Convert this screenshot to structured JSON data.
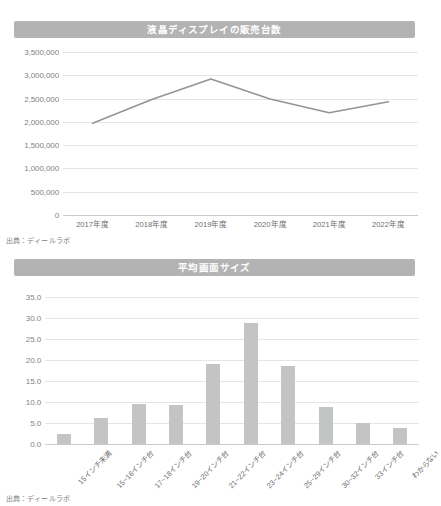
{
  "page": {
    "background_color": "#ffffff",
    "banner_color": "#b3b3b4",
    "bar_color": "#c3c4c5",
    "line_color": "#929497",
    "grid_color": "#e4e5e6"
  },
  "sales_panel": {
    "title": "液晶ディスプレイの販売台数",
    "source": "出典：ディールラボ"
  },
  "size_panel": {
    "title": "平均画面サイズ",
    "source": "出典：ディールラボ"
  },
  "chart_data": [
    {
      "type": "line",
      "title": "液晶ディスプレイの販売台数",
      "xlabel": "",
      "ylabel": "",
      "categories": [
        "2017年度",
        "2018年度",
        "2019年度",
        "2020年度",
        "2021年度",
        "2022年度"
      ],
      "values": [
        1970000,
        2480000,
        2920000,
        2490000,
        2195000,
        2430000
      ],
      "ytick_labels": [
        "0",
        "500,000",
        "1,000,000",
        "1,500,000",
        "2,000,000",
        "2,500,000",
        "3,000,000",
        "3,500,000"
      ],
      "ytick_values": [
        0,
        500000,
        1000000,
        1500000,
        2000000,
        2500000,
        3000000,
        3500000
      ],
      "ylim": [
        0,
        3500000
      ],
      "grid": true,
      "legend": "none",
      "series_color": "#929497",
      "source": "出典：ディールラボ"
    },
    {
      "type": "bar",
      "title": "平均画面サイズ",
      "xlabel": "",
      "ylabel": "",
      "categories": [
        "15インチ未満",
        "15~16インチ台",
        "17~18インチ台",
        "19~20インチ台",
        "21~22インチ台",
        "23~24インチ台",
        "25~29インチ台",
        "30~32インチ台",
        "33インチ台",
        "わからない"
      ],
      "values": [
        2.4,
        6.2,
        9.6,
        9.3,
        19.1,
        28.9,
        18.5,
        8.8,
        5.0,
        3.7
      ],
      "ytick_labels": [
        "0.0",
        "5.0",
        "10.0",
        "15.0",
        "20.0",
        "25.0",
        "30.0",
        "35.0"
      ],
      "ytick_values": [
        0.0,
        5.0,
        10.0,
        15.0,
        20.0,
        25.0,
        30.0,
        35.0
      ],
      "ylim": [
        0,
        35
      ],
      "grid": true,
      "legend": "none",
      "series_color": "#c3c4c5",
      "source": "出典：ディールラボ"
    }
  ]
}
